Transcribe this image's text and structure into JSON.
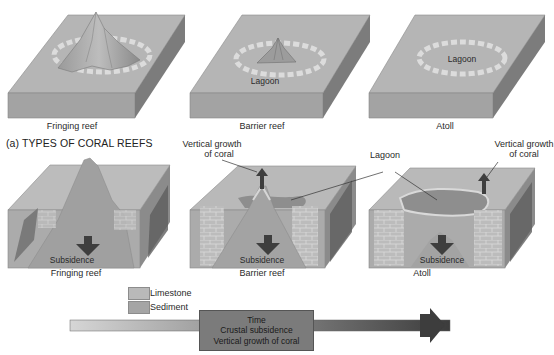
{
  "section_title": "(a) TYPES OF CORAL REEFS",
  "top_row": [
    {
      "caption": "Fringing reef",
      "inner_label": ""
    },
    {
      "caption": "Barrier reef",
      "inner_label": "Lagoon"
    },
    {
      "caption": "Atoll",
      "inner_label": "Lagoon"
    }
  ],
  "bottom_row": [
    {
      "caption": "Fringing reef",
      "subsidence_label": "Subsidence"
    },
    {
      "caption": "Barrier reef",
      "subsidence_label": "Subsidence"
    },
    {
      "caption": "Atoll",
      "subsidence_label": "Subsidence"
    }
  ],
  "callouts": {
    "vertical_growth_left_line1": "Vertical growth",
    "vertical_growth_left_line2": "of coral",
    "lagoon": "Lagoon",
    "vertical_growth_right_line1": "Vertical growth",
    "vertical_growth_right_line2": "of coral"
  },
  "legend": [
    {
      "label": "Limestone",
      "color": "#b9b9b9"
    },
    {
      "label": "Sediment",
      "color": "#a5a5a5"
    }
  ],
  "timeline": {
    "line1": "Time",
    "line2": "Crustal subsidence",
    "line3": "Vertical growth of coral"
  },
  "colors": {
    "block_top": "#b4b4b4",
    "block_front": "#a2a2a2",
    "block_side": "#7e7e7e",
    "reef_ring": "#d8d8d8",
    "arrow_dark": "#3e3e3e",
    "lagoon_fill": "#8e8e8e"
  }
}
